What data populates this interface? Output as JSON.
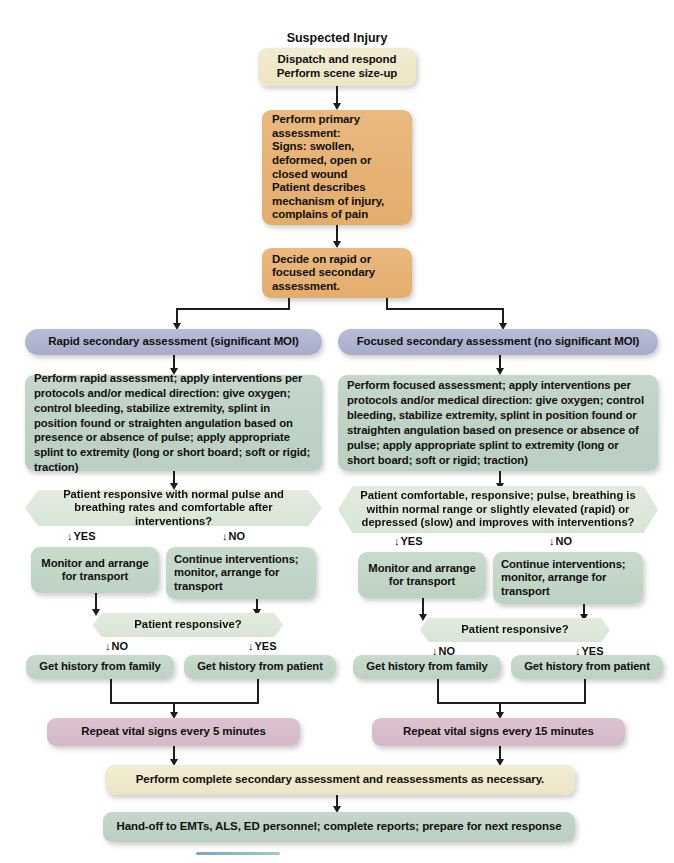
{
  "diagram": {
    "title": "Suspected Injury",
    "nodes": {
      "dispatch": "Dispatch and respond\nPerform scene size-up",
      "primary_assessment": "Perform primary assessment:\nSigns: swollen, deformed, open or closed wound\nPatient describes mechanism of injury, complains of pain",
      "decide": "Decide on rapid or focused secondary assessment.",
      "rapid_header": "Rapid secondary assessment (significant MOI)",
      "focused_header": "Focused secondary assessment (no significant MOI)",
      "rapid_perform": "Perform rapid assessment; apply interventions per protocols and/or medical direction: give oxygen; control bleeding, stabilize extremity, splint in position found or straighten angulation based on presence or absence of pulse; apply appropriate splint to extremity (long or short board; soft or rigid; traction)",
      "focused_perform": "Perform focused assessment; apply interventions per protocols and/or medical direction: give oxygen; control bleeding, stabilize extremity, splint in position found or straighten angulation based on presence or absence of pulse; apply appropriate splint to extremity (long or short board; soft or rigid; traction)",
      "rapid_decision": "Patient responsive with normal pulse and breathing rates and comfortable after interventions?",
      "focused_decision": "Patient comfortable, responsive; pulse, breathing is within normal range or slightly elevated (rapid) or depressed (slow) and improves with interventions?",
      "monitor_left": "Monitor and arrange for transport",
      "continue_left": "Continue interventions; monitor, arrange for transport",
      "monitor_right": "Monitor and arrange for transport",
      "continue_right": "Continue interventions; monitor, arrange for transport",
      "responsive_left": "Patient responsive?",
      "responsive_right": "Patient responsive?",
      "history_family_left": "Get history from family",
      "history_patient_left": "Get history from patient",
      "history_family_right": "Get history from family",
      "history_patient_right": "Get history from patient",
      "vitals_left": "Repeat vital signs every 5 minutes",
      "vitals_right": "Repeat vital signs every 15 minutes",
      "complete_secondary": "Perform complete secondary assessment and reassessments as necessary.",
      "handoff": "Hand-off to EMTs, ALS, ED personnel; complete reports; prepare for next response"
    },
    "branch_labels": {
      "yes": "YES",
      "no": "NO",
      "arrow_glyph": "↓"
    },
    "colors": {
      "cream": "#ece5c4",
      "tan": "#e3ad6c",
      "periwinkle": "#a7adc9",
      "sage": "#bacfc2",
      "mauve": "#d4b8c9",
      "hex_fill": "#d8e5d5",
      "connector": "#1d1d1d",
      "text": "#111111"
    }
  }
}
